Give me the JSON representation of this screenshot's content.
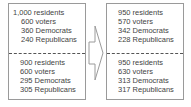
{
  "left": {
    "top": [
      "1,000 residents",
      "600 voters",
      "360 Democrats",
      "240 Republicans"
    ],
    "bottom": [
      "900 residents",
      "600 voters",
      "295 Democrats",
      "305 Republicans"
    ]
  },
  "right": {
    "top": [
      "950 residents",
      "570 voters",
      "342 Democrats",
      "228 Republicans"
    ],
    "bottom": [
      "950 residents",
      "630 voters",
      "313 Democrats",
      "317 Republicans"
    ]
  },
  "arrow": {
    "icon": "right-arrow-icon",
    "color": "#9a9a9a"
  }
}
